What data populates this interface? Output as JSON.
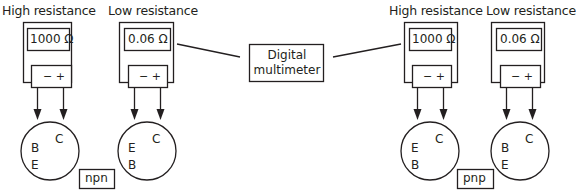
{
  "diagram": {
    "type": "transistor-multimeter-test",
    "colors": {
      "line": "#231f20",
      "background": "#ffffff"
    },
    "center_label": {
      "line1": "Digital",
      "line2": "multimeter"
    },
    "meters": [
      {
        "title": "High resistance",
        "reading": "1000 Ω",
        "terminals": "− +"
      },
      {
        "title": "Low resistance",
        "reading": "0.06 Ω",
        "terminals": "− +"
      },
      {
        "title": "High resistance",
        "reading": "1000 Ω",
        "terminals": "− +"
      },
      {
        "title": "Low resistance",
        "reading": "0.06 Ω",
        "terminals": "− +"
      }
    ],
    "transistors": [
      {
        "top_right": "C",
        "upper_left": "B",
        "lower_left": "E"
      },
      {
        "top_right": "C",
        "upper_left": "E",
        "lower_left": "B"
      },
      {
        "top_right": "C",
        "upper_left": "E",
        "lower_left": "B"
      },
      {
        "top_right": "C",
        "upper_left": "B",
        "lower_left": "E"
      }
    ],
    "groups": [
      {
        "label": "npn"
      },
      {
        "label": "pnp"
      }
    ]
  }
}
